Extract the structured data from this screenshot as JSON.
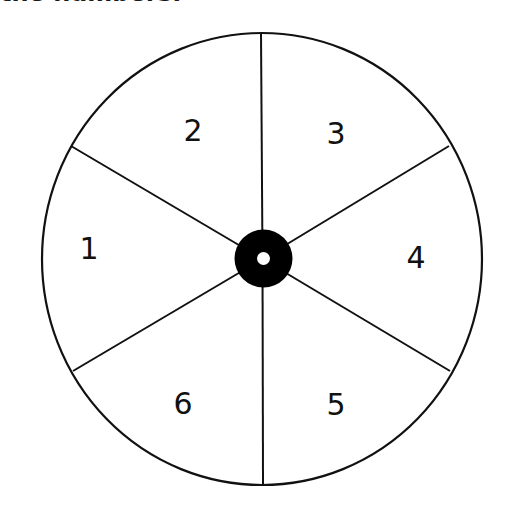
{
  "heading": {
    "text": "the numbers:",
    "clipped": true
  },
  "spinner": {
    "center": [
      262,
      259
    ],
    "radius_x": 220,
    "radius_y": 226,
    "sections": 6,
    "stroke_color": "#111111",
    "background": "#ffffff",
    "hub": {
      "outer_radius": 29,
      "inner_radius": 6.5,
      "color": "#000000"
    },
    "labels": [
      {
        "value": "1",
        "x": 89,
        "y": 248
      },
      {
        "value": "2",
        "x": 193,
        "y": 130
      },
      {
        "value": "3",
        "x": 336,
        "y": 133
      },
      {
        "value": "4",
        "x": 416,
        "y": 257
      },
      {
        "value": "5",
        "x": 336,
        "y": 404
      },
      {
        "value": "6",
        "x": 183,
        "y": 403
      }
    ]
  }
}
